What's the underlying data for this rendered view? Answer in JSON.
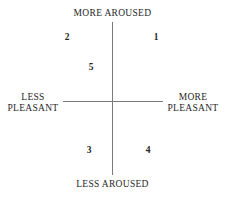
{
  "diagram": {
    "type": "affect-circumplex-quadrant",
    "background_color": "#ffffff",
    "axis_color": "#7a7a7a",
    "text_color": "#262626",
    "axes": {
      "top_label": "MORE AROUSED",
      "bottom_label": "LESS AROUSED",
      "left_label_line1": "LESS",
      "left_label_line2": "PLEASANT",
      "right_label_line1": "MORE",
      "right_label_line2": "PLEASANT"
    },
    "markers": [
      {
        "label": "1",
        "quadrant": "upper-right"
      },
      {
        "label": "2",
        "quadrant": "upper-left"
      },
      {
        "label": "5",
        "quadrant": "upper-left-inner"
      },
      {
        "label": "3",
        "quadrant": "lower-left"
      },
      {
        "label": "4",
        "quadrant": "lower-right"
      }
    ]
  }
}
